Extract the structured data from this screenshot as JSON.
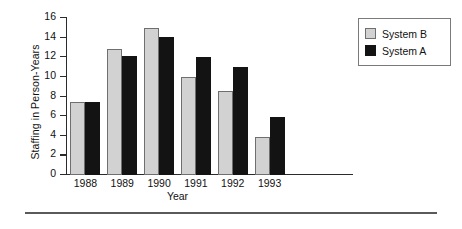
{
  "chart_data": {
    "type": "bar",
    "title": "",
    "xlabel": "Year",
    "ylabel": "Staffing in Person-Years",
    "categories": [
      "1988",
      "1989",
      "1990",
      "1991",
      "1992",
      "1993"
    ],
    "series": [
      {
        "name": "System B",
        "color": "#d2d2d2",
        "values": [
          7.4,
          12.8,
          14.9,
          9.9,
          8.5,
          3.9
        ]
      },
      {
        "name": "System A",
        "color": "#131313",
        "values": [
          7.4,
          12.1,
          14.0,
          12.0,
          10.9,
          5.9
        ]
      }
    ],
    "ylim": [
      0,
      16
    ],
    "yticks": [
      "0",
      "2",
      "4",
      "6",
      "8",
      "10",
      "12",
      "14",
      "16"
    ],
    "ytick_values": [
      0,
      2,
      4,
      6,
      8,
      10,
      12,
      14,
      16
    ],
    "grid": false,
    "legend_position": "right-top",
    "legend_entries": [
      "System B",
      "System A"
    ]
  },
  "legend": {
    "items": [
      {
        "label": "System B",
        "swatch": "light-gray-square"
      },
      {
        "label": "System A",
        "swatch": "black-square"
      }
    ]
  }
}
